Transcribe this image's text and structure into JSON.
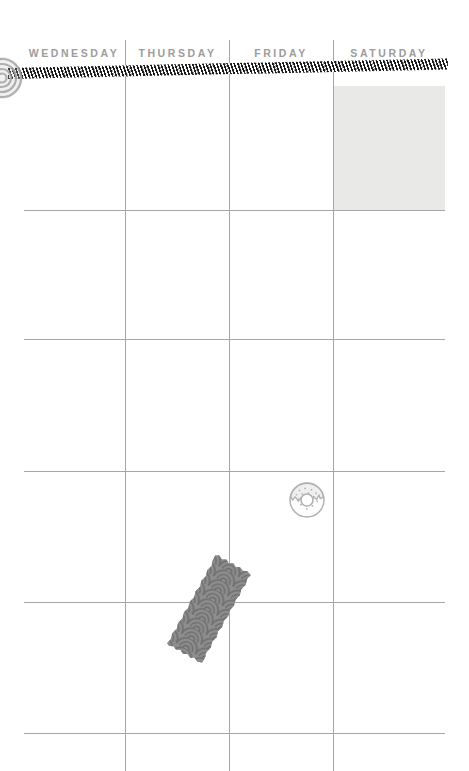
{
  "planner": {
    "type": "weekly-planner-page",
    "background_color": "#ffffff",
    "grid_line_color": "#a6a6a6",
    "header_text_color": "#9c9c9c",
    "columns": [
      {
        "label": "WEDNESDAY",
        "left": 22,
        "width": 104
      },
      {
        "label": "THURSDAY",
        "left": 126,
        "width": 103
      },
      {
        "label": "FRIDAY",
        "left": 229,
        "width": 104
      },
      {
        "label": "SATURDAY",
        "left": 333,
        "width": 112
      }
    ],
    "column_dividers_x": [
      125,
      229,
      333
    ],
    "row_dividers_y": [
      210,
      339,
      471,
      602,
      733
    ],
    "highlight_cell": {
      "column": "SATURDAY",
      "row": 1,
      "fill_color": "#e9e9e7",
      "left": 334,
      "top": 86,
      "width": 111,
      "height": 124
    },
    "decorations": [
      {
        "name": "washi-tape-stripe",
        "style": "diagonal black and white stripes",
        "colors": [
          "#111111",
          "#ffffff"
        ],
        "left": 8,
        "top": 68,
        "width": 440,
        "height": 11,
        "rotation_deg": -1.25
      },
      {
        "name": "stamp-sticker",
        "style": "circular concentric stamp, clipped by left page edge",
        "color": "#9a9a9a",
        "left": -20,
        "top": 56,
        "size": 44
      },
      {
        "name": "donut-sticker",
        "style": "donut with icing drips and sprinkles, line art",
        "color": "#b5b5b5",
        "left": 286,
        "top": 479,
        "size": 42
      },
      {
        "name": "washi-tape-wave",
        "style": "seigaiha wave / scallop pattern tape with torn edges",
        "colors": [
          "#8c8c8c",
          "#6f6f6f"
        ],
        "left": 186,
        "top": 556,
        "width": 46,
        "height": 106,
        "rotation_deg": 29
      }
    ]
  }
}
